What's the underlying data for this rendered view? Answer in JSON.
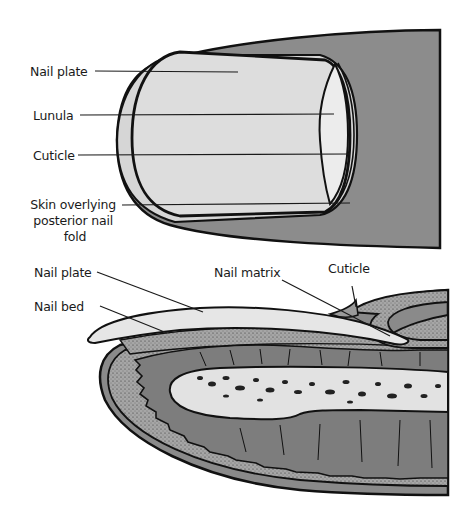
{
  "figure": {
    "colors": {
      "skin_dark": "#8c8c8c",
      "nail_light": "#d9d9d9",
      "nail_plate_light": "#e8e8e8",
      "bone_light": "#e2e2e2",
      "outline": "#111111",
      "background": "#ffffff"
    },
    "top_view": {
      "name": "Dorsal view of fingertip",
      "labels": [
        {
          "text": "Nail plate"
        },
        {
          "text": "Lunula"
        },
        {
          "text": "Cuticle"
        },
        {
          "lines": [
            "Skin overlying",
            "posterior nail",
            "fold"
          ]
        }
      ]
    },
    "cross_section": {
      "name": "Longitudinal section of fingertip",
      "labels": [
        {
          "text": "Nail plate"
        },
        {
          "text": "Nail bed"
        },
        {
          "text": "Nail matrix"
        },
        {
          "text": "Cuticle"
        }
      ]
    }
  }
}
